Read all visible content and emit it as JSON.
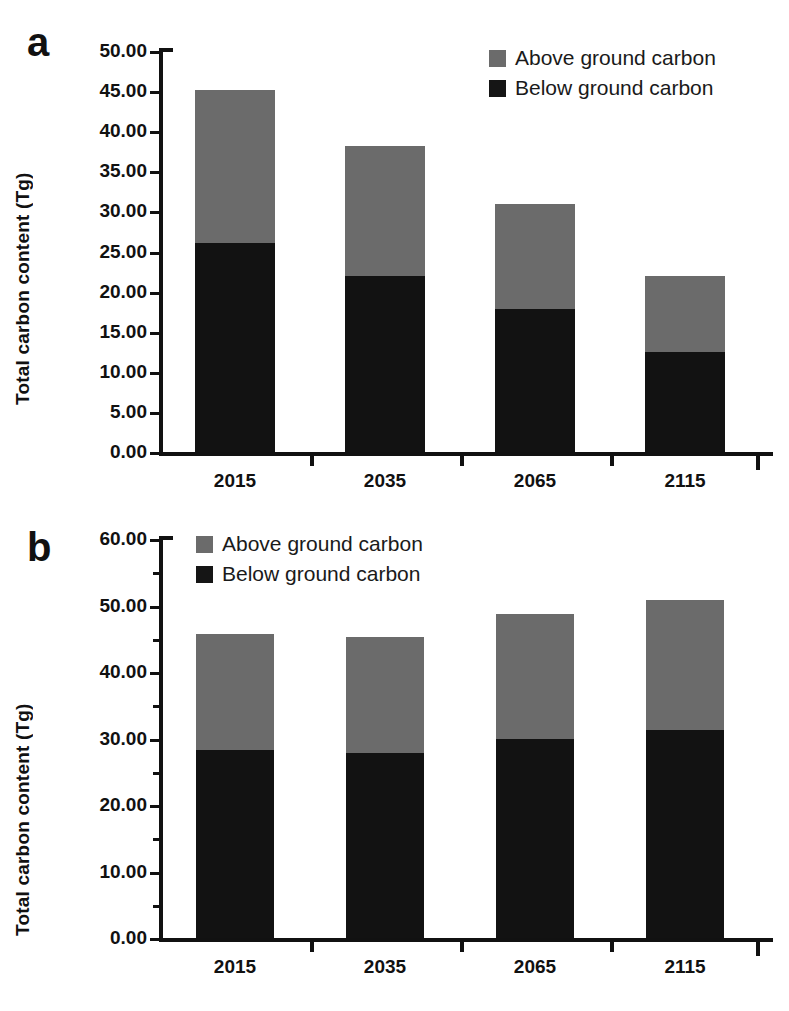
{
  "figure": {
    "panels": [
      {
        "letter": "a",
        "ylabel": "Total carbon content (Tg)",
        "legend": [
          {
            "label": "Above ground carbon",
            "color": "#6b6b6b",
            "key": "above"
          },
          {
            "label": "Below ground carbon",
            "color": "#151515",
            "key": "below"
          }
        ],
        "yticks": [
          "0.00",
          "5.00",
          "10.00",
          "15.00",
          "20.00",
          "25.00",
          "30.00",
          "35.00",
          "40.00",
          "45.00",
          "50.00"
        ],
        "xticks": [
          "2015",
          "2035",
          "2065",
          "2115"
        ]
      },
      {
        "letter": "b",
        "ylabel": "Total carbon content (Tg)",
        "legend": [
          {
            "label": "Above ground carbon",
            "color": "#6b6b6b",
            "key": "above"
          },
          {
            "label": "Below ground carbon",
            "color": "#151515",
            "key": "below"
          }
        ],
        "yticks": [
          "0.00",
          "10.00",
          "20.00",
          "30.00",
          "40.00",
          "50.00",
          "60.00"
        ],
        "xticks": [
          "2015",
          "2035",
          "2065",
          "2115"
        ]
      }
    ]
  },
  "chart_data": [
    {
      "panel": "a",
      "type": "bar",
      "stacked": true,
      "title": "",
      "xlabel": "",
      "ylabel": "Total carbon content (Tg)",
      "categories": [
        "2015",
        "2035",
        "2065",
        "2115"
      ],
      "series": [
        {
          "name": "Below ground carbon",
          "color": "#121212",
          "values": [
            26.1,
            22.0,
            17.8,
            12.5
          ]
        },
        {
          "name": "Above ground carbon",
          "color": "#6b6b6b",
          "values": [
            19.1,
            16.1,
            13.1,
            9.4
          ]
        }
      ],
      "totals": [
        45.2,
        38.1,
        30.9,
        21.9
      ],
      "ylim": [
        0,
        50
      ],
      "ytick_step": 5,
      "grid": false,
      "legend_position": "top-right"
    },
    {
      "panel": "b",
      "type": "bar",
      "stacked": true,
      "title": "",
      "xlabel": "",
      "ylabel": "Total carbon content (Tg)",
      "categories": [
        "2015",
        "2035",
        "2065",
        "2115"
      ],
      "series": [
        {
          "name": "Below ground carbon",
          "color": "#121212",
          "values": [
            28.3,
            27.8,
            30.0,
            31.3
          ]
        },
        {
          "name": "Above ground carbon",
          "color": "#6b6b6b",
          "values": [
            17.4,
            17.4,
            18.7,
            19.5
          ]
        }
      ],
      "totals": [
        45.7,
        45.2,
        48.7,
        50.8
      ],
      "ylim": [
        0,
        60
      ],
      "ytick_step": 10,
      "grid": false,
      "legend_position": "top-left"
    }
  ]
}
